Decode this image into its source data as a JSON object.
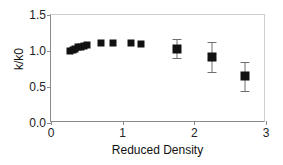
{
  "chart_data": {
    "type": "scatter",
    "title": "",
    "xlabel": "Reduced Density",
    "ylabel": "k/k0",
    "xlim": [
      0,
      3
    ],
    "ylim": [
      0.0,
      1.5
    ],
    "xticks": [
      "0",
      "1",
      "2",
      "3"
    ],
    "xtick_values": [
      0,
      1,
      2,
      3
    ],
    "yticks": [
      "0.0",
      "0.5",
      "1.0",
      "1.5"
    ],
    "ytick_values": [
      0.0,
      0.5,
      1.0,
      1.5
    ],
    "grid": false,
    "legend": "none",
    "marker": "filled-square",
    "marker_color": "#111111",
    "errorbar_color": "#6f6f6f",
    "series": [
      {
        "name": "k/k0 vs reduced density",
        "points": [
          {
            "x": 0.26,
            "y": 1.0,
            "yerr": 0
          },
          {
            "x": 0.3,
            "y": 1.01,
            "yerr": 0
          },
          {
            "x": 0.34,
            "y": 1.03,
            "yerr": 0
          },
          {
            "x": 0.38,
            "y": 1.05,
            "yerr": 0
          },
          {
            "x": 0.42,
            "y": 1.06,
            "yerr": 0
          },
          {
            "x": 0.46,
            "y": 1.07,
            "yerr": 0
          },
          {
            "x": 0.5,
            "y": 1.08,
            "yerr": 0
          },
          {
            "x": 0.7,
            "y": 1.11,
            "yerr": 0
          },
          {
            "x": 0.86,
            "y": 1.11,
            "yerr": 0
          },
          {
            "x": 1.12,
            "y": 1.11,
            "yerr": 0
          },
          {
            "x": 1.26,
            "y": 1.1,
            "yerr": 0
          },
          {
            "x": 1.76,
            "y": 1.03,
            "yerr": 0.13
          },
          {
            "x": 2.25,
            "y": 0.92,
            "yerr": 0.21
          },
          {
            "x": 2.7,
            "y": 0.65,
            "yerr": 0.2
          }
        ]
      }
    ]
  }
}
